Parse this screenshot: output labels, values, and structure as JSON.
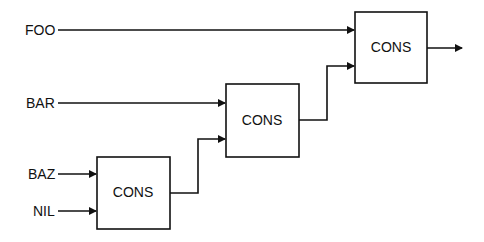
{
  "diagram": {
    "title": "",
    "inputs": [
      {
        "id": "foo",
        "label": "FOO"
      },
      {
        "id": "bar",
        "label": "BAR"
      },
      {
        "id": "baz",
        "label": "BAZ"
      },
      {
        "id": "nil",
        "label": "NIL"
      }
    ],
    "boxes": [
      {
        "id": "cons-bottom",
        "label": "CONS",
        "inputs": [
          "BAZ",
          "NIL"
        ]
      },
      {
        "id": "cons-middle",
        "label": "CONS",
        "inputs": [
          "BAR",
          "cons-bottom"
        ]
      },
      {
        "id": "cons-top",
        "label": "CONS",
        "inputs": [
          "FOO",
          "cons-middle"
        ]
      }
    ],
    "output": "cons-top output arrow"
  }
}
